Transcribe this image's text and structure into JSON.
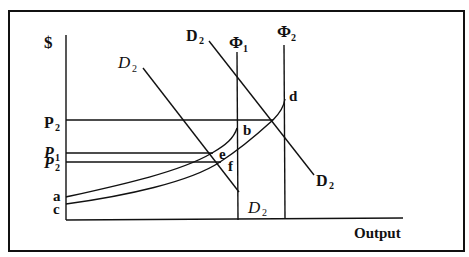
{
  "diagram": {
    "title": "",
    "axes": {
      "y_label": "$",
      "x_label": "Output"
    },
    "price_labels": [
      {
        "id": "p2_upper",
        "main": "P",
        "sub": "2",
        "style": "bold"
      },
      {
        "id": "p1",
        "main": "P",
        "sub": "1",
        "style": "italic"
      },
      {
        "id": "p2_lower",
        "main": "P",
        "sub": "2",
        "style": "italic"
      }
    ],
    "origin_labels": [
      "a",
      "c"
    ],
    "capacity_lines": [
      {
        "id": "phi1",
        "main": "Φ",
        "sub": "1"
      },
      {
        "id": "phi2",
        "main": "Φ",
        "sub": "2"
      }
    ],
    "demand_curves": [
      {
        "id": "demand_left",
        "top_label": {
          "main": "D",
          "sub": "2",
          "style": "italic"
        },
        "bottom_label": {
          "main": "D",
          "sub": "2",
          "style": "italic"
        }
      },
      {
        "id": "demand_right",
        "top_label": {
          "main": "D",
          "sub": "2",
          "style": "bold"
        },
        "bottom_label": {
          "main": "D",
          "sub": "2",
          "style": "bold"
        }
      }
    ],
    "points": [
      "b",
      "d",
      "e",
      "f"
    ],
    "colors": {
      "ink": "#111111",
      "background": "#ffffff"
    }
  }
}
